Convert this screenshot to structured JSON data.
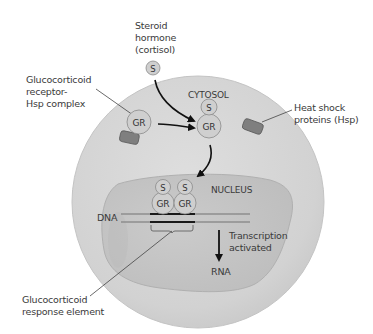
{
  "diagram": {
    "compartments": {
      "cytosol": "CYTOSOL",
      "nucleus": "NUCLEUS"
    },
    "labels": {
      "steroid_hormone": "Steroid\nhormone\n(cortisol)",
      "gr_hsp_complex": "Glucocorticoid\nreceptor-\nHsp complex",
      "heat_shock": "Heat shock\nproteins (Hsp)",
      "dna": "DNA",
      "transcription": "Transcription\nactivated",
      "rna": "RNA",
      "gre": "Glucocorticoid\nresponse element"
    },
    "molecules": {
      "steroid_symbol": "S",
      "receptor_symbol": "GR"
    },
    "colors": {
      "cell_fill": "#d4d4d4",
      "cell_edge": "#c4c4c4",
      "nucleus_fill": "#c6c6c6",
      "nucleus_edge": "#b0b0b0",
      "molecule_fill": "#cfcfcf",
      "molecule_stroke": "#8a8a8a",
      "hsp_fill": "#7f7f7f",
      "hsp_stroke": "#5a5a5a",
      "dna_strand": "#8e8e8e",
      "gre_segment": "#1a1a1a",
      "arrow": "#111111",
      "text": "#3a3a3a"
    }
  }
}
